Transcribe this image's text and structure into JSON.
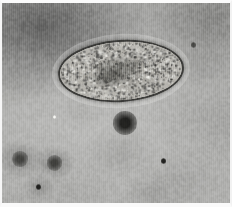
{
  "figure": {
    "name": "light-micrograph",
    "modality": "brightfield light microscopy",
    "width_px": 232,
    "height_px": 207,
    "visible_text": "",
    "colors": {
      "border": "#fbfbfb",
      "background_light": "#bcbcba",
      "background_mid": "#a9a9a8",
      "background_dark": "#3a3a38",
      "organism_wall": "#3a3a38",
      "organism_interior": "#b4b2ac",
      "debris_dark": "#2a2a28",
      "highlight_speck": "#f2f2ee"
    }
  },
  "plate": {
    "border_top_px": 3,
    "border_left_px": 2,
    "border_right_px": 2,
    "border_bottom_px": 4
  },
  "organism": {
    "label": "ovoid cyst",
    "left_px": 56,
    "top_px": 37,
    "width_px": 126,
    "height_px": 62,
    "rotation_deg": -3.5,
    "wall_thickness_px": 2.2,
    "interior": "dense granular cytoplasm with darker central mass"
  },
  "background_features": [
    {
      "name": "dark-blob-upper-left",
      "cx_pct": 18,
      "cy_pct": 12,
      "rx_pct": 30,
      "ry_pct": 22,
      "tone": "very dark"
    },
    {
      "name": "dark-haze-upper-right",
      "cx_pct": 92,
      "cy_pct": 8,
      "rx_pct": 22,
      "ry_pct": 19,
      "tone": "dark"
    },
    {
      "name": "debris-spot-center",
      "cx_pct": 54,
      "cy_pct": 60,
      "r_px": 9,
      "tone": "very dark"
    },
    {
      "name": "debris-spot-lower-left-a",
      "cx_pct": 8,
      "cy_pct": 78,
      "r_px": 6,
      "tone": "dark"
    },
    {
      "name": "debris-spot-lower-left-b",
      "cx_pct": 23,
      "cy_pct": 80,
      "r_px": 6,
      "tone": "dark"
    },
    {
      "name": "debris-dot-lower-left",
      "cx_pct": 16,
      "cy_pct": 92,
      "r_px": 2,
      "tone": "very dark"
    },
    {
      "name": "debris-dot-right",
      "cx_pct": 71,
      "cy_pct": 79,
      "r_px": 2,
      "tone": "very dark"
    },
    {
      "name": "debris-dot-upper-right",
      "cx_pct": 84,
      "cy_pct": 21,
      "r_px": 2,
      "tone": "dark"
    },
    {
      "name": "highlight-speck",
      "cx_pct": 23,
      "cy_pct": 57,
      "r_px": 1.4,
      "tone": "bright"
    }
  ],
  "artifacts": {
    "scan_striping": "fine vertical lines across whole field",
    "grain": "photographic film grain"
  }
}
